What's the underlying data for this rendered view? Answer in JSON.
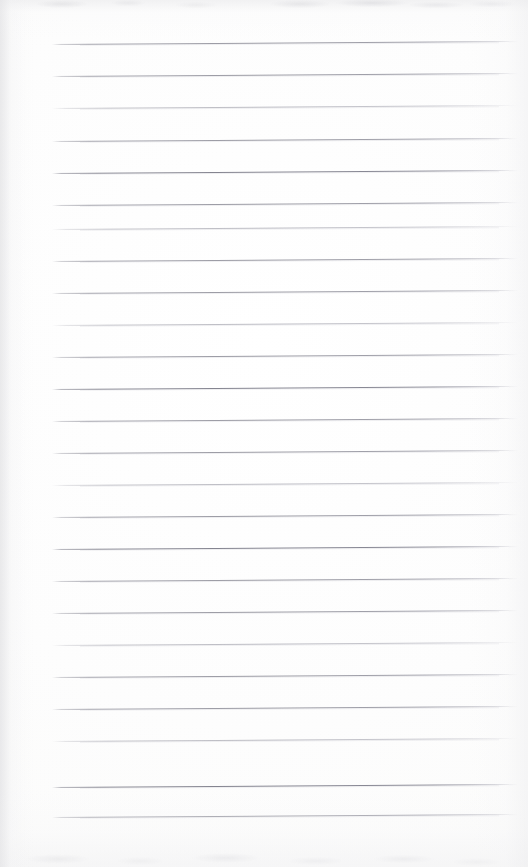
{
  "page": {
    "kind": "scanned-lined-notebook-paper",
    "width": 528,
    "height": 867,
    "visible_text": "",
    "description_label": "Blank ruled notebook page scan"
  },
  "colors": {
    "paper": "#fefefe",
    "paper_tint": "#fbfbfa",
    "rule_ink": "#9a9aa3",
    "rule_ink_heavy": "#82828e",
    "rule_ink_faint": "#acacb5",
    "edge_shadow": "#e2e2e5"
  },
  "ruling": {
    "line_count": 25,
    "first_line_y": 44,
    "line_spacing": 32.2,
    "line_start_x": 52,
    "line_end_x": 518,
    "line_thickness": 1,
    "skew_degrees": -0.36,
    "margin_line": "none",
    "holes": "none"
  },
  "lines": [
    {
      "index": 1,
      "y": 44,
      "weight": "normal"
    },
    {
      "index": 2,
      "y": 76,
      "weight": "normal"
    },
    {
      "index": 3,
      "y": 108,
      "weight": "faint"
    },
    {
      "index": 4,
      "y": 141,
      "weight": "normal"
    },
    {
      "index": 5,
      "y": 173,
      "weight": "heavy"
    },
    {
      "index": 6,
      "y": 205,
      "weight": "normal"
    },
    {
      "index": 7,
      "y": 229,
      "weight": "faint"
    },
    {
      "index": 8,
      "y": 261,
      "weight": "normal"
    },
    {
      "index": 9,
      "y": 293,
      "weight": "normal"
    },
    {
      "index": 10,
      "y": 325,
      "weight": "faint"
    },
    {
      "index": 11,
      "y": 357,
      "weight": "normal"
    },
    {
      "index": 12,
      "y": 389,
      "weight": "heavy"
    },
    {
      "index": 13,
      "y": 421,
      "weight": "normal"
    },
    {
      "index": 14,
      "y": 453,
      "weight": "normal"
    },
    {
      "index": 15,
      "y": 485,
      "weight": "faint"
    },
    {
      "index": 16,
      "y": 517,
      "weight": "normal"
    },
    {
      "index": 17,
      "y": 549,
      "weight": "heavy"
    },
    {
      "index": 18,
      "y": 581,
      "weight": "normal"
    },
    {
      "index": 19,
      "y": 613,
      "weight": "normal"
    },
    {
      "index": 20,
      "y": 645,
      "weight": "faint"
    },
    {
      "index": 21,
      "y": 677,
      "weight": "normal"
    },
    {
      "index": 22,
      "y": 709,
      "weight": "normal"
    },
    {
      "index": 23,
      "y": 741,
      "weight": "faint"
    },
    {
      "index": 24,
      "y": 787,
      "weight": "heavy"
    },
    {
      "index": 25,
      "y": 817,
      "weight": "normal"
    }
  ],
  "artifacts": {
    "top_band": "faint gray scanner smudge band across the top edge",
    "bottom_band": "faint gray scanner smudge band across the bottom edge",
    "left_edge": "soft shadow gradient along the left margin",
    "right_edge": "soft light falloff along the right margin"
  }
}
